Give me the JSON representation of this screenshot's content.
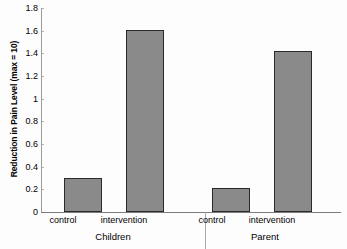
{
  "chart_data": {
    "type": "bar",
    "title": "",
    "xlabel": "",
    "ylabel": "Reduction in Pain Level (max = 10)",
    "ylim": [
      0,
      1.8
    ],
    "yticks": [
      "0",
      "0.2",
      "0.4",
      "0.6",
      "0.8",
      "1",
      "1.2",
      "1.4",
      "1.6",
      "1.8"
    ],
    "ytick_values": [
      0,
      0.2,
      0.4,
      0.6,
      0.8,
      1,
      1.2,
      1.4,
      1.6,
      1.8
    ],
    "grid": false,
    "legend": "none",
    "categories": [
      "control",
      "intervention",
      "control",
      "intervention"
    ],
    "groups": [
      {
        "label": "Children",
        "categories": [
          "control",
          "intervention"
        ],
        "values": [
          0.3,
          1.61
        ]
      },
      {
        "label": "Parent",
        "categories": [
          "control",
          "intervention"
        ],
        "values": [
          0.21,
          1.42
        ]
      }
    ],
    "values": [
      0.3,
      1.61,
      0.21,
      1.42
    ],
    "bar_color": "#8a8a8a",
    "bar_border_color": "#2b2b2b",
    "axis_color": "#7d7d7d",
    "background_color": "#fdfdfd"
  }
}
